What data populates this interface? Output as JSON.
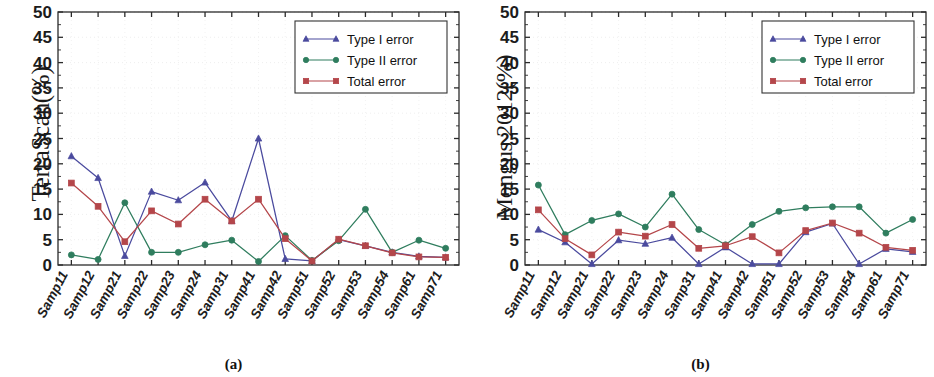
{
  "figure": {
    "panels": [
      {
        "id": "a",
        "caption": "(a)",
        "ylabel": "TerraScan(%)"
      },
      {
        "id": "b",
        "caption": "(b)",
        "ylabel": "Mongus 2012(%)"
      }
    ]
  },
  "legend": {
    "entries": [
      {
        "label": "Type I error",
        "color": "#4a4a9e",
        "marker": "triangle"
      },
      {
        "label": "Type II error",
        "color": "#2f7d5e",
        "marker": "circle"
      },
      {
        "label": "Total error",
        "color": "#b4464a",
        "marker": "square"
      }
    ]
  },
  "axis": {
    "y_ticks": [
      "0",
      "5",
      "10",
      "15",
      "20",
      "25",
      "30",
      "35",
      "40",
      "45",
      "50"
    ],
    "x_ticks": [
      "Samp11",
      "Samp12",
      "Samp21",
      "Samp22",
      "Samp23",
      "Samp24",
      "Samp31",
      "Samp41",
      "Samp42",
      "Samp51",
      "Samp52",
      "Samp53",
      "Samp54",
      "Samp61",
      "Samp71"
    ]
  },
  "chart_data": [
    {
      "type": "line",
      "title": "",
      "panel": "(a)",
      "xlabel": "",
      "ylabel": "TerraScan(%)",
      "ylim": [
        0,
        50
      ],
      "ytick_step": 5,
      "grid": true,
      "legend_position": "top-right",
      "categories": [
        "Samp11",
        "Samp12",
        "Samp21",
        "Samp22",
        "Samp23",
        "Samp24",
        "Samp31",
        "Samp41",
        "Samp42",
        "Samp51",
        "Samp52",
        "Samp53",
        "Samp54",
        "Samp61",
        "Samp71"
      ],
      "series": [
        {
          "name": "Type I error",
          "color": "#4a4a9e",
          "marker": "triangle",
          "values": [
            21.5,
            17.2,
            1.8,
            14.5,
            12.8,
            16.3,
            8.7,
            25.0,
            1.2,
            0.8,
            5.0,
            3.8,
            2.5,
            1.7,
            1.5
          ]
        },
        {
          "name": "Type II error",
          "color": "#2f7d5e",
          "marker": "circle",
          "values": [
            2.0,
            1.1,
            12.3,
            2.5,
            2.5,
            4.0,
            4.9,
            0.7,
            5.8,
            0.9,
            4.8,
            11.0,
            2.5,
            4.9,
            3.3
          ]
        },
        {
          "name": "Total error",
          "color": "#b4464a",
          "marker": "square",
          "values": [
            16.2,
            11.6,
            4.6,
            10.7,
            8.1,
            13.0,
            8.7,
            13.0,
            5.2,
            0.8,
            5.1,
            3.8,
            2.4,
            1.6,
            1.5
          ]
        }
      ]
    },
    {
      "type": "line",
      "title": "",
      "panel": "(b)",
      "xlabel": "",
      "ylabel": "Mongus 2012(%)",
      "ylim": [
        0,
        50
      ],
      "ytick_step": 5,
      "grid": true,
      "legend_position": "top-right",
      "categories": [
        "Samp11",
        "Samp12",
        "Samp21",
        "Samp22",
        "Samp23",
        "Samp24",
        "Samp31",
        "Samp41",
        "Samp42",
        "Samp51",
        "Samp52",
        "Samp53",
        "Samp54",
        "Samp61",
        "Samp71"
      ],
      "series": [
        {
          "name": "Type I error",
          "color": "#4a4a9e",
          "marker": "triangle",
          "values": [
            7.0,
            4.5,
            0.2,
            4.9,
            4.2,
            5.4,
            0.2,
            3.5,
            0.2,
            0.2,
            6.5,
            8.2,
            0.2,
            3.2,
            2.6
          ]
        },
        {
          "name": "Type II error",
          "color": "#2f7d5e",
          "marker": "circle",
          "values": [
            15.8,
            6.0,
            8.8,
            10.1,
            7.5,
            14.0,
            7.0,
            4.0,
            8.0,
            10.6,
            11.3,
            11.5,
            11.5,
            6.3,
            9.0
          ]
        },
        {
          "name": "Total error",
          "color": "#b4464a",
          "marker": "square",
          "values": [
            10.9,
            5.2,
            2.0,
            6.5,
            5.7,
            8.0,
            3.3,
            3.8,
            5.6,
            2.4,
            6.8,
            8.3,
            6.3,
            3.5,
            2.9
          ]
        }
      ]
    }
  ]
}
